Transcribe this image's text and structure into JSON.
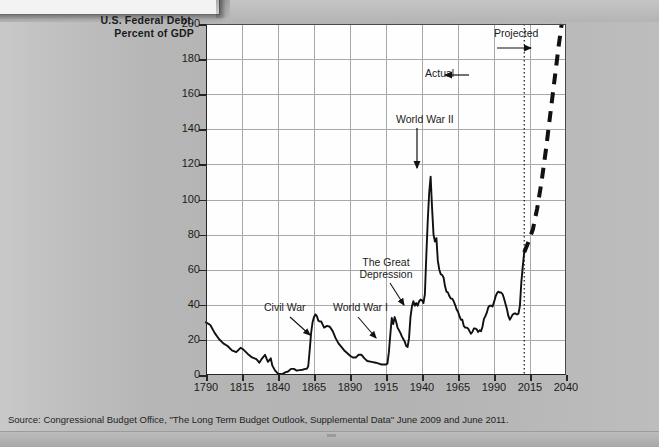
{
  "chart_title_line1": "U.S. Federal Debt,",
  "chart_title_line2": "Percent of GDP",
  "source_note": "Source: Congressional Budget Office, \"The Long Term Budget Outlook, Supplemental Data\" June 2009 and June 2011.",
  "annotations": {
    "civil_war": "Civil War",
    "world_war_1": "World War I",
    "great_depression_line1": "The Great",
    "great_depression_line2": "Depression",
    "world_war_2": "World War II",
    "actual": "Actual",
    "projected": "Projected"
  },
  "chart_data": {
    "type": "line",
    "title": "U.S. Federal Debt, Percent of GDP",
    "xlabel": "",
    "ylabel": "Percent of GDP",
    "xlim": [
      1790,
      2040
    ],
    "ylim": [
      0,
      200
    ],
    "yticks": [
      0,
      20,
      40,
      60,
      80,
      100,
      120,
      140,
      160,
      180,
      200
    ],
    "xticks": [
      1790,
      1815,
      1840,
      1865,
      1890,
      1915,
      1940,
      1965,
      1990,
      2015,
      2040
    ],
    "grid": true,
    "legend": "none",
    "divider_year": 2011,
    "divider_style": "dotted-vertical",
    "series": [
      {
        "name": "Actual",
        "style": "solid",
        "color": "#111111",
        "points": [
          [
            1790,
            30.0
          ],
          [
            1793,
            28.5
          ],
          [
            1796,
            24.0
          ],
          [
            1799,
            20.5
          ],
          [
            1802,
            18.0
          ],
          [
            1805,
            16.5
          ],
          [
            1808,
            14.0
          ],
          [
            1811,
            13.0
          ],
          [
            1814,
            15.5
          ],
          [
            1816,
            14.5
          ],
          [
            1819,
            12.0
          ],
          [
            1822,
            10.0
          ],
          [
            1825,
            9.0
          ],
          [
            1827,
            7.0
          ],
          [
            1829,
            9.5
          ],
          [
            1831,
            11.5
          ],
          [
            1833,
            7.5
          ],
          [
            1835,
            9.5
          ],
          [
            1836,
            5.5
          ],
          [
            1838,
            2.5
          ],
          [
            1840,
            0.8
          ],
          [
            1843,
            0.5
          ],
          [
            1845,
            1.5
          ],
          [
            1847,
            2.0
          ],
          [
            1849,
            3.5
          ],
          [
            1851,
            3.5
          ],
          [
            1853,
            2.5
          ],
          [
            1855,
            2.8
          ],
          [
            1857,
            3.0
          ],
          [
            1859,
            3.5
          ],
          [
            1860,
            3.5
          ],
          [
            1861,
            5.0
          ],
          [
            1862,
            14.0
          ],
          [
            1863,
            24.0
          ],
          [
            1864,
            30.0
          ],
          [
            1865,
            33.0
          ],
          [
            1866,
            34.5
          ],
          [
            1867,
            33.5
          ],
          [
            1868,
            31.0
          ],
          [
            1869,
            30.5
          ],
          [
            1870,
            30.5
          ],
          [
            1872,
            27.0
          ],
          [
            1874,
            28.0
          ],
          [
            1876,
            27.5
          ],
          [
            1878,
            25.0
          ],
          [
            1880,
            21.0
          ],
          [
            1882,
            18.0
          ],
          [
            1884,
            16.0
          ],
          [
            1886,
            14.0
          ],
          [
            1888,
            12.5
          ],
          [
            1890,
            11.0
          ],
          [
            1892,
            10.0
          ],
          [
            1894,
            10.0
          ],
          [
            1896,
            11.5
          ],
          [
            1898,
            11.5
          ],
          [
            1900,
            9.5
          ],
          [
            1902,
            8.0
          ],
          [
            1905,
            7.5
          ],
          [
            1908,
            7.0
          ],
          [
            1910,
            6.5
          ],
          [
            1912,
            6.0
          ],
          [
            1914,
            6.0
          ],
          [
            1915,
            6.0
          ],
          [
            1916,
            6.5
          ],
          [
            1917,
            13.0
          ],
          [
            1918,
            23.0
          ],
          [
            1919,
            32.5
          ],
          [
            1920,
            29.0
          ],
          [
            1921,
            33.0
          ],
          [
            1922,
            30.5
          ],
          [
            1923,
            27.0
          ],
          [
            1924,
            25.5
          ],
          [
            1925,
            24.0
          ],
          [
            1926,
            22.0
          ],
          [
            1927,
            20.5
          ],
          [
            1928,
            19.0
          ],
          [
            1929,
            16.5
          ],
          [
            1930,
            16.0
          ],
          [
            1931,
            21.0
          ],
          [
            1932,
            33.0
          ],
          [
            1933,
            39.0
          ],
          [
            1934,
            42.0
          ],
          [
            1935,
            39.5
          ],
          [
            1936,
            41.0
          ],
          [
            1937,
            39.5
          ],
          [
            1938,
            42.0
          ],
          [
            1939,
            43.0
          ],
          [
            1940,
            42.5
          ],
          [
            1941,
            41.0
          ],
          [
            1942,
            46.0
          ],
          [
            1943,
            68.0
          ],
          [
            1944,
            88.0
          ],
          [
            1945,
            104.0
          ],
          [
            1946,
            113.0
          ],
          [
            1947,
            95.0
          ],
          [
            1948,
            80.0
          ],
          [
            1949,
            76.0
          ],
          [
            1950,
            78.0
          ],
          [
            1951,
            65.0
          ],
          [
            1952,
            60.0
          ],
          [
            1953,
            57.5
          ],
          [
            1954,
            57.0
          ],
          [
            1955,
            55.5
          ],
          [
            1956,
            50.5
          ],
          [
            1957,
            47.5
          ],
          [
            1958,
            47.0
          ],
          [
            1959,
            45.0
          ],
          [
            1960,
            43.5
          ],
          [
            1961,
            43.5
          ],
          [
            1962,
            42.0
          ],
          [
            1963,
            40.0
          ],
          [
            1964,
            37.5
          ],
          [
            1965,
            36.0
          ],
          [
            1966,
            33.5
          ],
          [
            1967,
            31.5
          ],
          [
            1968,
            31.5
          ],
          [
            1969,
            28.0
          ],
          [
            1970,
            27.0
          ],
          [
            1971,
            27.0
          ],
          [
            1972,
            26.5
          ],
          [
            1973,
            25.0
          ],
          [
            1974,
            23.5
          ],
          [
            1975,
            24.5
          ],
          [
            1976,
            26.5
          ],
          [
            1977,
            26.5
          ],
          [
            1978,
            26.0
          ],
          [
            1979,
            24.5
          ],
          [
            1980,
            25.5
          ],
          [
            1981,
            25.0
          ],
          [
            1982,
            27.5
          ],
          [
            1983,
            32.0
          ],
          [
            1984,
            33.5
          ],
          [
            1985,
            35.5
          ],
          [
            1986,
            38.5
          ],
          [
            1987,
            39.5
          ],
          [
            1988,
            39.5
          ],
          [
            1989,
            39.0
          ],
          [
            1990,
            41.5
          ],
          [
            1991,
            44.5
          ],
          [
            1992,
            46.5
          ],
          [
            1993,
            47.5
          ],
          [
            1994,
            47.0
          ],
          [
            1995,
            47.0
          ],
          [
            1996,
            46.0
          ],
          [
            1997,
            43.5
          ],
          [
            1998,
            40.5
          ],
          [
            1999,
            37.5
          ],
          [
            2000,
            33.5
          ],
          [
            2001,
            31.5
          ],
          [
            2002,
            33.0
          ],
          [
            2003,
            34.5
          ],
          [
            2004,
            35.0
          ],
          [
            2005,
            35.0
          ],
          [
            2006,
            34.5
          ],
          [
            2007,
            35.0
          ],
          [
            2008,
            39.5
          ],
          [
            2009,
            53.0
          ],
          [
            2010,
            62.0
          ],
          [
            2011,
            70.0
          ]
        ]
      },
      {
        "name": "Projected",
        "style": "dashed",
        "color": "#111111",
        "points": [
          [
            2011,
            70.0
          ],
          [
            2014,
            76.0
          ],
          [
            2017,
            83.0
          ],
          [
            2020,
            95.0
          ],
          [
            2023,
            110.0
          ],
          [
            2026,
            128.0
          ],
          [
            2029,
            148.0
          ],
          [
            2032,
            168.0
          ],
          [
            2035,
            188.0
          ],
          [
            2037,
            200.0
          ]
        ]
      }
    ]
  }
}
